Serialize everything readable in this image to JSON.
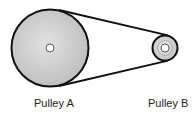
{
  "diagram": {
    "type": "belt-drive",
    "pulleys": [
      {
        "id": "A",
        "label": "Pulley A",
        "cx": 50,
        "cy": 48,
        "r": 39,
        "hole_r": 4
      },
      {
        "id": "B",
        "label": "Pulley B",
        "cx": 165,
        "cy": 48,
        "r": 13,
        "hole_r": 4
      }
    ],
    "colors": {
      "belt": "#111111",
      "pulley_fill": "#cfcfcf",
      "outline": "#111111",
      "hole": "#ffffff"
    }
  }
}
